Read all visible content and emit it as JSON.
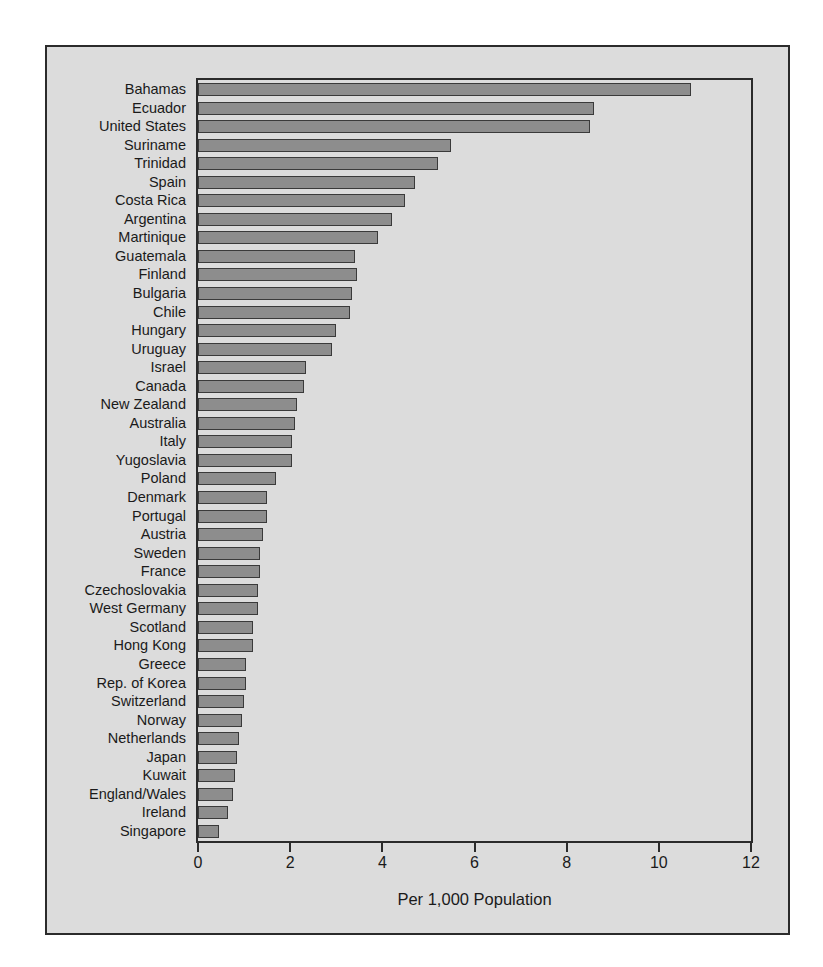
{
  "chart_data": {
    "type": "bar",
    "orientation": "horizontal",
    "title": "",
    "xlabel": "Per 1,000 Population",
    "ylabel": "",
    "xlim": [
      0,
      12
    ],
    "xticks": [
      0,
      2,
      4,
      6,
      8,
      10,
      12
    ],
    "xticklabels": [
      "0",
      "2",
      "4",
      "6",
      "8",
      "10",
      "12"
    ],
    "grid": false,
    "legend": null,
    "bar_color": "#8d8d8d",
    "bar_edge_color": "#3a3a3a",
    "background_color": "#dcdcdc",
    "categories": [
      "Bahamas",
      "Ecuador",
      "United States",
      "Suriname",
      "Trinidad",
      "Spain",
      "Costa Rica",
      "Argentina",
      "Martinique",
      "Guatemala",
      "Finland",
      "Bulgaria",
      "Chile",
      "Hungary",
      "Uruguay",
      "Israel",
      "Canada",
      "New Zealand",
      "Australia",
      "Italy",
      "Yugoslavia",
      "Poland",
      "Denmark",
      "Portugal",
      "Austria",
      "Sweden",
      "France",
      "Czechoslovakia",
      "West Germany",
      "Scotland",
      "Hong Kong",
      "Greece",
      "Rep. of Korea",
      "Switzerland",
      "Norway",
      "Netherlands",
      "Japan",
      "Kuwait",
      "England/Wales",
      "Ireland",
      "Singapore"
    ],
    "values": [
      10.7,
      8.6,
      8.5,
      5.5,
      5.2,
      4.7,
      4.5,
      4.2,
      3.9,
      3.4,
      3.45,
      3.35,
      3.3,
      3.0,
      2.9,
      2.35,
      2.3,
      2.15,
      2.1,
      2.05,
      2.05,
      1.7,
      1.5,
      1.5,
      1.4,
      1.35,
      1.35,
      1.3,
      1.3,
      1.2,
      1.2,
      1.05,
      1.05,
      1.0,
      0.95,
      0.9,
      0.85,
      0.8,
      0.75,
      0.65,
      0.45
    ]
  }
}
